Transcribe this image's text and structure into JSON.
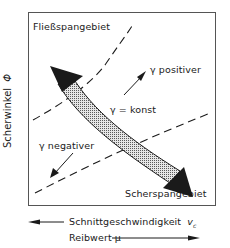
{
  "diagram": {
    "y_axis_label": "Scherwinkel",
    "y_axis_symbol": "Φ",
    "region_top": "Fließspangebiet",
    "region_bottom": "Scherspangebiet",
    "label_gamma_positive": "γ  positiver",
    "label_gamma_constant": "γ = konst",
    "label_gamma_negative": "γ  negativer",
    "x_axis_label_1": "Schnittgeschwindigkeit",
    "x_axis_symbol_1": "vc",
    "x_axis_label_2": "Reibwert μ",
    "x_axis_1_direction": "left",
    "x_axis_2_direction": "right",
    "colors": {
      "line": "#1a1a1a",
      "frame": "#555555",
      "hatch": "#9a9a9a",
      "background": "#ffffff"
    }
  }
}
